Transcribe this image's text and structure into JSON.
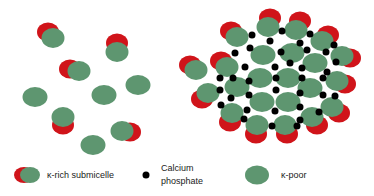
{
  "colors": {
    "green": "#5e9670",
    "red": "#d0141a",
    "dot": "#000000",
    "background": "#ffffff"
  },
  "left_panel": {
    "poor": [
      {
        "x": 35,
        "y": 97
      },
      {
        "x": 104,
        "y": 95
      },
      {
        "x": 138,
        "y": 85
      },
      {
        "x": 93,
        "y": 145
      }
    ],
    "rich": [
      {
        "x": 53,
        "y": 38,
        "dx": -5,
        "dy": -6
      },
      {
        "x": 117,
        "y": 52,
        "dx": 0,
        "dy": -9
      },
      {
        "x": 79,
        "y": 71,
        "dx": -9,
        "dy": -2
      },
      {
        "x": 63,
        "y": 117,
        "dx": 0,
        "dy": 8
      },
      {
        "x": 122,
        "y": 131,
        "dx": 8,
        "dy": 1
      }
    ]
  },
  "right_panel": {
    "poor": [
      {
        "x": 263,
        "y": 55
      },
      {
        "x": 292,
        "y": 53
      },
      {
        "x": 315,
        "y": 63
      },
      {
        "x": 260,
        "y": 78
      },
      {
        "x": 288,
        "y": 78
      },
      {
        "x": 237,
        "y": 87
      },
      {
        "x": 310,
        "y": 88
      },
      {
        "x": 262,
        "y": 102
      },
      {
        "x": 288,
        "y": 102
      }
    ],
    "rich": [
      {
        "x": 237,
        "y": 37,
        "dx": -6,
        "dy": -6
      },
      {
        "x": 268,
        "y": 27,
        "dx": 2,
        "dy": -9
      },
      {
        "x": 296,
        "y": 30,
        "dx": 4,
        "dy": -9
      },
      {
        "x": 322,
        "y": 41,
        "dx": 6,
        "dy": -6
      },
      {
        "x": 342,
        "y": 56,
        "dx": 8,
        "dy": 2
      },
      {
        "x": 227,
        "y": 67,
        "dx": -6,
        "dy": -6
      },
      {
        "x": 196,
        "y": 70,
        "dx": -6,
        "dy": -5
      },
      {
        "x": 337,
        "y": 81,
        "dx": 8,
        "dy": 3
      },
      {
        "x": 208,
        "y": 93,
        "dx": -6,
        "dy": 6
      },
      {
        "x": 332,
        "y": 107,
        "dx": 7,
        "dy": 6
      },
      {
        "x": 232,
        "y": 113,
        "dx": -2,
        "dy": 9
      },
      {
        "x": 312,
        "y": 117,
        "dx": 5,
        "dy": 8
      },
      {
        "x": 257,
        "y": 125,
        "dx": -1,
        "dy": 9
      },
      {
        "x": 285,
        "y": 125,
        "dx": 2,
        "dy": 9
      }
    ],
    "dots": [
      {
        "x": 252,
        "y": 35
      },
      {
        "x": 282,
        "y": 31
      },
      {
        "x": 310,
        "y": 34
      },
      {
        "x": 334,
        "y": 45
      },
      {
        "x": 270,
        "y": 41
      },
      {
        "x": 300,
        "y": 43
      },
      {
        "x": 250,
        "y": 48
      },
      {
        "x": 336,
        "y": 62
      },
      {
        "x": 235,
        "y": 53
      },
      {
        "x": 281,
        "y": 52
      },
      {
        "x": 307,
        "y": 50
      },
      {
        "x": 326,
        "y": 52
      },
      {
        "x": 275,
        "y": 67
      },
      {
        "x": 302,
        "y": 68
      },
      {
        "x": 245,
        "y": 67
      },
      {
        "x": 327,
        "y": 72
      },
      {
        "x": 290,
        "y": 63
      },
      {
        "x": 220,
        "y": 78
      },
      {
        "x": 233,
        "y": 78
      },
      {
        "x": 249,
        "y": 81
      },
      {
        "x": 276,
        "y": 78
      },
      {
        "x": 302,
        "y": 78
      },
      {
        "x": 323,
        "y": 78
      },
      {
        "x": 220,
        "y": 90
      },
      {
        "x": 231,
        "y": 98
      },
      {
        "x": 249,
        "y": 95
      },
      {
        "x": 276,
        "y": 90
      },
      {
        "x": 300,
        "y": 93
      },
      {
        "x": 323,
        "y": 95
      },
      {
        "x": 335,
        "y": 96
      },
      {
        "x": 221,
        "y": 105
      },
      {
        "x": 247,
        "y": 110
      },
      {
        "x": 275,
        "y": 111
      },
      {
        "x": 300,
        "y": 107
      },
      {
        "x": 319,
        "y": 112
      },
      {
        "x": 244,
        "y": 119
      },
      {
        "x": 300,
        "y": 120
      },
      {
        "x": 272,
        "y": 126
      },
      {
        "x": 297,
        "y": 126
      }
    ]
  },
  "legend": {
    "rich_label": "κ-rich submicelle",
    "calcium_label_line1": "Calcium",
    "calcium_label_line2": "phosphate",
    "poor_label": "κ-poor"
  }
}
